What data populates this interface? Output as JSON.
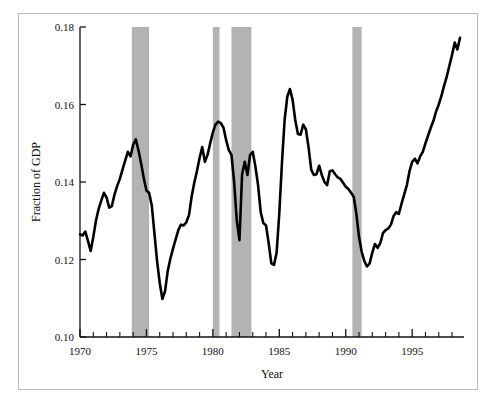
{
  "figure": {
    "frame_color": "#b9b9b9",
    "background": "#ffffff",
    "line_color": "#000000",
    "band_color": "#b3b3b3"
  },
  "chart_data": {
    "type": "line",
    "title": "",
    "xlabel": "Year",
    "ylabel": "Fraction of GDP",
    "xlim": [
      1970,
      1998.9
    ],
    "ylim": [
      0.1,
      0.18
    ],
    "grid": false,
    "legend": null,
    "x_ticks_major": [
      1970,
      1975,
      1980,
      1985,
      1990,
      1995
    ],
    "x_tick_labels": [
      "1970",
      "1975",
      "1980",
      "1985",
      "1990",
      "1995"
    ],
    "x_ticks_minor": [
      1971,
      1972,
      1973,
      1974,
      1976,
      1977,
      1978,
      1979,
      1981,
      1982,
      1983,
      1984,
      1986,
      1987,
      1988,
      1989,
      1991,
      1992,
      1993,
      1994,
      1996,
      1997,
      1998
    ],
    "y_ticks": [
      0.1,
      0.12,
      0.14,
      0.16,
      0.18
    ],
    "y_tick_labels": [
      "0.10",
      "0.12",
      "0.14",
      "0.16",
      "0.18"
    ],
    "shaded_regions_label": "recession bands",
    "shaded_regions": [
      {
        "start": 1973.9,
        "end": 1975.2
      },
      {
        "start": 1980.0,
        "end": 1980.5
      },
      {
        "start": 1981.4,
        "end": 1982.9
      },
      {
        "start": 1990.5,
        "end": 1991.2
      }
    ],
    "series": [
      {
        "name": "Fraction of GDP",
        "x": [
          1970.0,
          1970.2,
          1970.4,
          1970.6,
          1970.8,
          1971.0,
          1971.2,
          1971.4,
          1971.6,
          1971.8,
          1972.0,
          1972.2,
          1972.4,
          1972.6,
          1972.8,
          1973.0,
          1973.2,
          1973.4,
          1973.6,
          1973.8,
          1974.0,
          1974.2,
          1974.4,
          1974.6,
          1974.8,
          1975.0,
          1975.2,
          1975.4,
          1975.6,
          1975.8,
          1976.0,
          1976.2,
          1976.4,
          1976.6,
          1976.8,
          1977.0,
          1977.2,
          1977.4,
          1977.6,
          1977.8,
          1978.0,
          1978.2,
          1978.4,
          1978.6,
          1978.8,
          1979.0,
          1979.2,
          1979.4,
          1979.6,
          1979.8,
          1980.0,
          1980.2,
          1980.4,
          1980.6,
          1980.8,
          1981.0,
          1981.2,
          1981.4,
          1981.6,
          1981.8,
          1982.0,
          1982.2,
          1982.4,
          1982.6,
          1982.8,
          1983.0,
          1983.2,
          1983.4,
          1983.6,
          1983.8,
          1984.0,
          1984.2,
          1984.4,
          1984.6,
          1984.8,
          1985.0,
          1985.2,
          1985.4,
          1985.6,
          1985.8,
          1986.0,
          1986.2,
          1986.4,
          1986.6,
          1986.8,
          1987.0,
          1987.2,
          1987.4,
          1987.6,
          1987.8,
          1988.0,
          1988.2,
          1988.4,
          1988.6,
          1988.8,
          1989.0,
          1989.2,
          1989.4,
          1989.6,
          1989.8,
          1990.0,
          1990.2,
          1990.4,
          1990.6,
          1990.8,
          1991.0,
          1991.2,
          1991.4,
          1991.6,
          1991.8,
          1992.0,
          1992.2,
          1992.4,
          1992.6,
          1992.8,
          1993.0,
          1993.2,
          1993.4,
          1993.6,
          1993.8,
          1994.0,
          1994.2,
          1994.4,
          1994.6,
          1994.8,
          1995.0,
          1995.2,
          1995.4,
          1995.6,
          1995.8,
          1996.0,
          1996.2,
          1996.4,
          1996.6,
          1996.8,
          1997.0,
          1997.2,
          1997.4,
          1997.6,
          1997.8,
          1998.0,
          1998.2,
          1998.4,
          1998.6
        ],
        "y": [
          0.1265,
          0.1262,
          0.1272,
          0.1248,
          0.1222,
          0.1258,
          0.13,
          0.133,
          0.1352,
          0.1372,
          0.136,
          0.1334,
          0.1338,
          0.1368,
          0.139,
          0.1408,
          0.1432,
          0.1455,
          0.1478,
          0.1466,
          0.1496,
          0.151,
          0.1482,
          0.1448,
          0.141,
          0.1378,
          0.1372,
          0.134,
          0.1268,
          0.1196,
          0.114,
          0.1098,
          0.1118,
          0.117,
          0.1202,
          0.1228,
          0.1252,
          0.1276,
          0.129,
          0.1288,
          0.1296,
          0.1314,
          0.1362,
          0.1398,
          0.1428,
          0.1462,
          0.149,
          0.1452,
          0.147,
          0.15,
          0.1528,
          0.1548,
          0.1556,
          0.1552,
          0.154,
          0.1508,
          0.1482,
          0.147,
          0.14,
          0.13,
          0.125,
          0.142,
          0.1452,
          0.1418,
          0.147,
          0.1478,
          0.144,
          0.1392,
          0.1322,
          0.1294,
          0.1288,
          0.1242,
          0.119,
          0.1186,
          0.1218,
          0.132,
          0.145,
          0.156,
          0.162,
          0.164,
          0.1612,
          0.156,
          0.1524,
          0.1522,
          0.1548,
          0.1536,
          0.149,
          0.1432,
          0.1418,
          0.142,
          0.1442,
          0.1418,
          0.14,
          0.1392,
          0.1428,
          0.143,
          0.142,
          0.1412,
          0.1408,
          0.1398,
          0.1388,
          0.1382,
          0.1372,
          0.1362,
          0.1318,
          0.1258,
          0.122,
          0.1196,
          0.1182,
          0.119,
          0.1218,
          0.124,
          0.123,
          0.1242,
          0.1268,
          0.1276,
          0.128,
          0.129,
          0.1312,
          0.1322,
          0.1318,
          0.1344,
          0.1368,
          0.1392,
          0.1428,
          0.1452,
          0.146,
          0.1448,
          0.1466,
          0.1478,
          0.15,
          0.152,
          0.154,
          0.1558,
          0.1582,
          0.16,
          0.1622,
          0.1648,
          0.1672,
          0.17,
          0.1728,
          0.176,
          0.1742,
          0.1772
        ]
      }
    ]
  }
}
